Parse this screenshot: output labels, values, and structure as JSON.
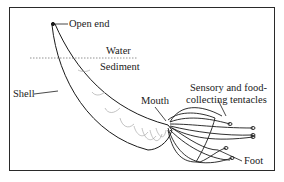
{
  "diagram": {
    "labels": {
      "open_end": "Open end",
      "water": "Water",
      "sediment": "Sediment",
      "shell": "Shell",
      "mouth": "Mouth",
      "tentacles_line1": "Sensory and food-",
      "tentacles_line2": "collecting tentacles",
      "foot": "Foot"
    },
    "colors": {
      "ink": "#1a1a1a",
      "frame": "#2a2a2a",
      "background": "#ffffff",
      "hatch": "#9a9a9a"
    }
  }
}
